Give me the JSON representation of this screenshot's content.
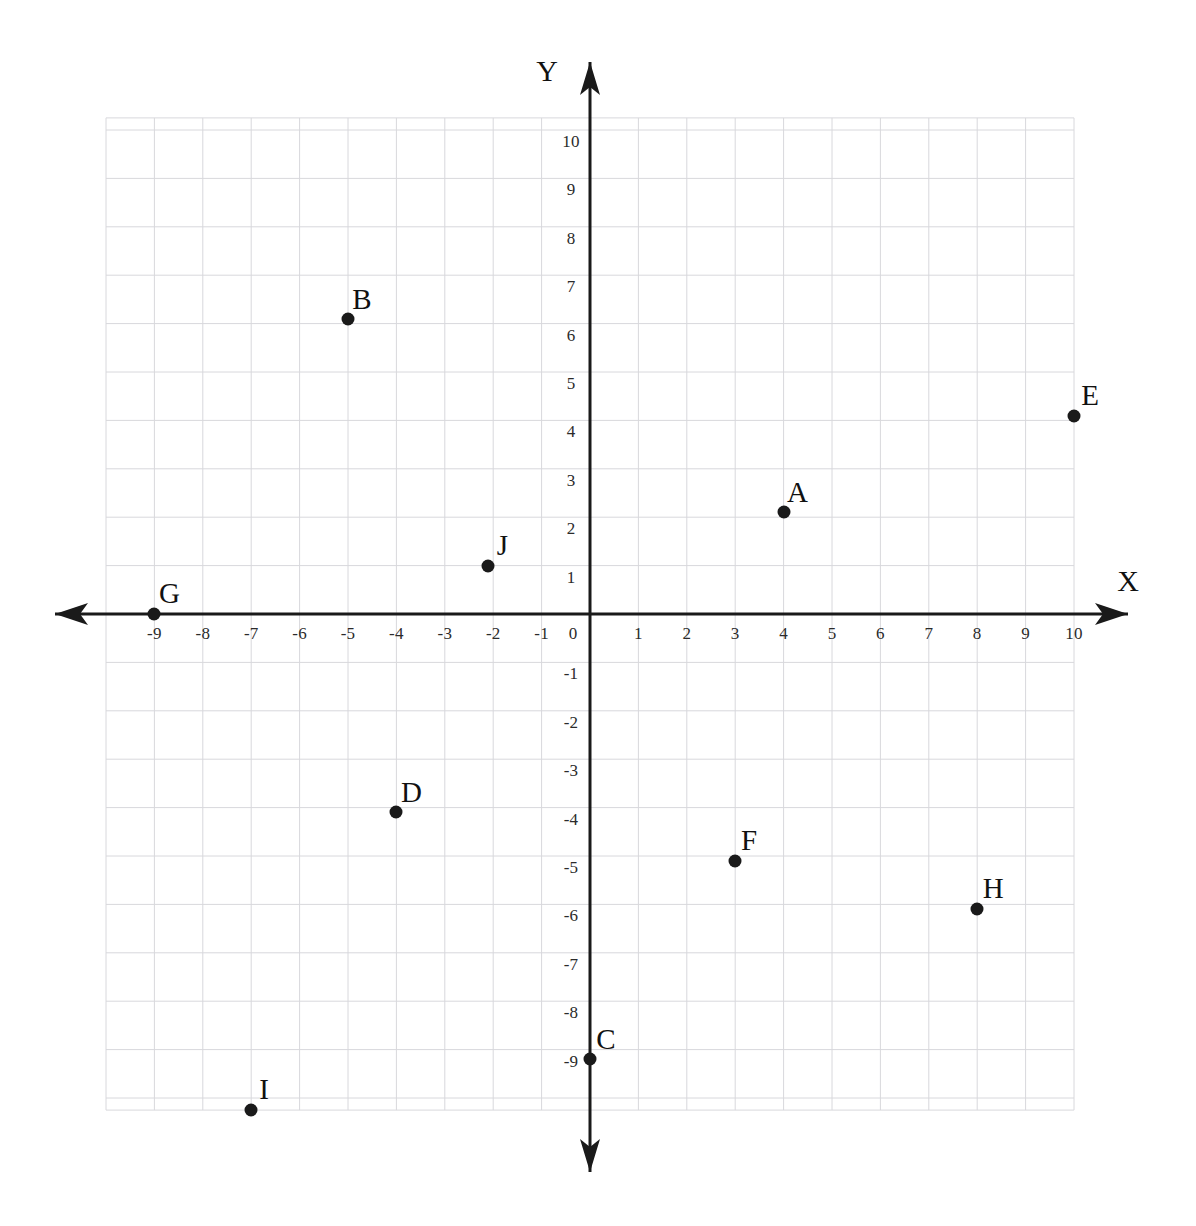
{
  "chart_data": {
    "type": "scatter",
    "title": "",
    "xlabel": "X",
    "ylabel": "Y",
    "xlim": [
      -10,
      10
    ],
    "ylim": [
      -10,
      10
    ],
    "grid": true,
    "legend": "none",
    "x_tick_labels": [
      "-9",
      "-8",
      "-7",
      "-6",
      "-5",
      "-4",
      "-3",
      "-2",
      "-1",
      "0",
      "1",
      "2",
      "3",
      "4",
      "5",
      "6",
      "7",
      "8",
      "9",
      "10"
    ],
    "x_tick_values": [
      -9,
      -8,
      -7,
      -6,
      -5,
      -4,
      -3,
      -2,
      -1,
      0,
      1,
      2,
      3,
      4,
      5,
      6,
      7,
      8,
      9,
      10
    ],
    "y_tick_labels": [
      "10",
      "9",
      "8",
      "7",
      "6",
      "5",
      "4",
      "3",
      "2",
      "1",
      "-1",
      "-2",
      "-3",
      "-4",
      "-5",
      "-6",
      "-7",
      "-8",
      "-9"
    ],
    "y_tick_values": [
      10,
      9,
      8,
      7,
      6,
      5,
      4,
      3,
      2,
      1,
      -1,
      -2,
      -3,
      -4,
      -5,
      -6,
      -7,
      -8,
      -9
    ],
    "points": [
      {
        "label": "A",
        "x": 4.0,
        "y": 2.1,
        "label_dx": 14,
        "label_dy": -20
      },
      {
        "label": "B",
        "x": -5.0,
        "y": 6.1,
        "label_dx": 14,
        "label_dy": -20
      },
      {
        "label": "C",
        "x": 0.0,
        "y": -9.2,
        "label_dx": 16,
        "label_dy": -20
      },
      {
        "label": "D",
        "x": -4.0,
        "y": -4.1,
        "label_dx": 15,
        "label_dy": -20
      },
      {
        "label": "E",
        "x": 10.0,
        "y": 4.1,
        "label_dx": 16,
        "label_dy": -21
      },
      {
        "label": "F",
        "x": 3.0,
        "y": -5.1,
        "label_dx": 14,
        "label_dy": -21
      },
      {
        "label": "G",
        "x": -9.0,
        "y": 0.0,
        "label_dx": 15,
        "label_dy": -21
      },
      {
        "label": "H",
        "x": 8.0,
        "y": -6.1,
        "label_dx": 16,
        "label_dy": -21
      },
      {
        "label": "I",
        "x": -7.0,
        "y": -10.25,
        "label_dx": 13,
        "label_dy": -21
      },
      {
        "label": "J",
        "x": -2.1,
        "y": 1.0,
        "label_dx": 14,
        "label_dy": -21
      }
    ],
    "axis_arrows": [
      "left",
      "right",
      "up",
      "down"
    ],
    "colors": {
      "grid": "#d8d8dc",
      "axis": "#1a1a1a",
      "point": "#1a1a1a",
      "text": "#111111",
      "background": "#ffffff"
    }
  }
}
